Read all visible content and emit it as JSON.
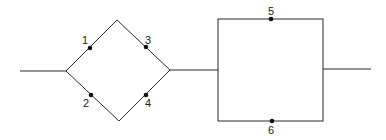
{
  "diagram": {
    "type": "network",
    "colors": {
      "line": "#2a2a2a",
      "node": "#111111",
      "background": "#ffffff"
    },
    "nodes": [
      {
        "id": "1",
        "label": "1"
      },
      {
        "id": "2",
        "label": "2"
      },
      {
        "id": "3",
        "label": "3"
      },
      {
        "id": "4",
        "label": "4"
      },
      {
        "id": "5",
        "label": "5"
      },
      {
        "id": "6",
        "label": "6"
      }
    ],
    "structure": {
      "block_a": {
        "shape": "diamond",
        "upper_branch": [
          "1",
          "3"
        ],
        "lower_branch": [
          "2",
          "4"
        ]
      },
      "block_b": {
        "shape": "rectangle",
        "top_branch": [
          "5"
        ],
        "bottom_branch": [
          "6"
        ]
      },
      "connection": "block_a in series with block_b"
    }
  }
}
